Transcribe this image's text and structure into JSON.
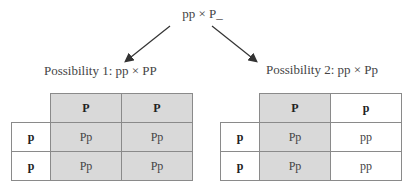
{
  "cross": "pp × P_",
  "possibilities": [
    {
      "label": "Possibility 1: pp × PP",
      "col_headers": [
        "P",
        "P"
      ],
      "col_shaded": [
        true,
        true
      ],
      "row_headers": [
        "p",
        "p"
      ],
      "cells": [
        [
          "Pp",
          "Pp"
        ],
        [
          "Pp",
          "Pp"
        ]
      ],
      "cell_shaded": [
        [
          true,
          true
        ],
        [
          true,
          true
        ]
      ]
    },
    {
      "label": "Possibility 2: pp × Pp",
      "col_headers": [
        "P",
        "p"
      ],
      "col_shaded": [
        true,
        false
      ],
      "row_headers": [
        "p",
        "p"
      ],
      "cells": [
        [
          "Pp",
          "pp"
        ],
        [
          "Pp",
          "pp"
        ]
      ],
      "cell_shaded": [
        [
          true,
          false
        ],
        [
          true,
          false
        ]
      ]
    }
  ],
  "colors": {
    "shade": "#d9d9d9",
    "border": "#8a8a8a"
  }
}
